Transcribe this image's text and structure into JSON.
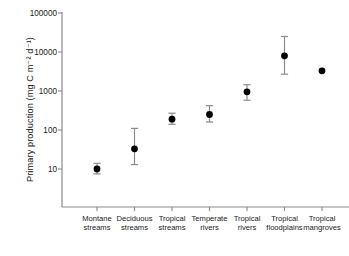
{
  "chart_data": {
    "type": "scatter",
    "title": "",
    "xlabel": "",
    "ylabel": "Primary production (mg C m⁻² d⁻¹)",
    "yscale": "log",
    "ylim": [
      1,
      100000
    ],
    "grid": false,
    "legend": null,
    "ytick_labels": [
      "100000",
      "10000",
      "1000",
      "100",
      "10"
    ],
    "ytick_values": [
      100000,
      10000,
      1000,
      100,
      10
    ],
    "categories": [
      "Montane streams",
      "Deciduous streams",
      "Tropical streams",
      "Temperate rivers",
      "Tropical rivers",
      "Tropical floodplains",
      "Tropical mangroves"
    ],
    "category_lines": [
      [
        "Montane",
        "streams"
      ],
      [
        "Deciduous",
        "streams"
      ],
      [
        "Tropical",
        "streams"
      ],
      [
        "Temperate",
        "rivers"
      ],
      [
        "Tropical",
        "rivers"
      ],
      [
        "Tropical",
        "floodplains"
      ],
      [
        "Tropical",
        "mangroves"
      ]
    ],
    "values": [
      10,
      33,
      190,
      250,
      950,
      8000,
      3300
    ],
    "err_low": [
      7.5,
      13,
      140,
      160,
      580,
      2700,
      null
    ],
    "err_high": [
      14,
      110,
      270,
      420,
      1450,
      25000,
      null
    ],
    "marker": "filled-circle",
    "marker_color": "#000000",
    "errorbar_color": "#8c8c8c",
    "axis_color": "#8a8a8a"
  }
}
